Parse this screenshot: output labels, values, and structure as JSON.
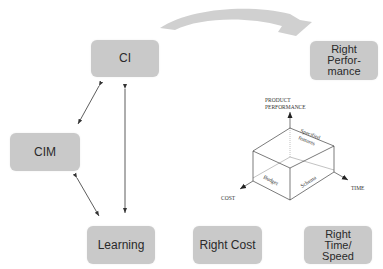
{
  "nodes": {
    "ci": {
      "label": "CI"
    },
    "right_performance": {
      "label": "Right\nPerfor-\nmance"
    },
    "cim": {
      "label": "CIM"
    },
    "learning": {
      "label": "Learning"
    },
    "right_cost": {
      "label": "Right Cost"
    },
    "right_time_speed": {
      "label": "Right\nTime/\nSpeed"
    }
  },
  "cube_diagram": {
    "y_axis_label_line1": "PRODUCT",
    "y_axis_label_line2": "PERFORMANCE",
    "x_axis_label": "TIME",
    "z_axis_label": "COST",
    "top_face_label_line1": "Specified",
    "top_face_label_line2": "features",
    "left_face_label": "Budget",
    "right_face_label": "Schema"
  },
  "edges": [
    {
      "from": "CI",
      "to": "CIM",
      "type": "bidirectional"
    },
    {
      "from": "CIM",
      "to": "Learning",
      "type": "bidirectional"
    },
    {
      "from": "CI",
      "to": "Learning",
      "type": "bidirectional"
    },
    {
      "from": "CI",
      "to": "Right Performance",
      "type": "curved-arrow"
    }
  ],
  "colors": {
    "box_fill": "#c9c9c9",
    "curved_arrow": "#d0d0d0",
    "line": "#333333"
  }
}
